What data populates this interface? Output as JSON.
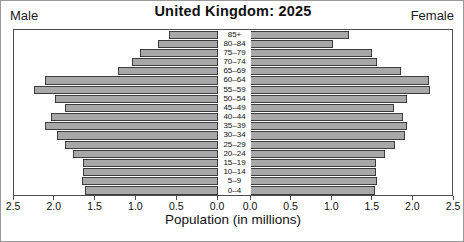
{
  "figure": {
    "title": "United Kingdom: 2025",
    "left_corner_label": "Male",
    "right_corner_label": "Female",
    "axis_title": "Population (in millions)"
  },
  "axis": {
    "left_ticks": [
      "2.5",
      "2.0",
      "1.5",
      "1.0",
      "0.5",
      "0.0"
    ],
    "right_ticks": [
      "0.0",
      "0.5",
      "1.0",
      "1.5",
      "2.0",
      "2.5"
    ]
  },
  "chart_data": {
    "type": "bar",
    "subtype": "population-pyramid",
    "title": "United Kingdom: 2025",
    "xlabel": "Population (in millions)",
    "ylabel": "",
    "xlim": [
      0,
      2.5
    ],
    "grid": false,
    "legend_position": "corners",
    "orientation": "horizontal",
    "categories": [
      "85+",
      "80-84",
      "75-79",
      "70-74",
      "65-69",
      "60-64",
      "55-59",
      "50-54",
      "45-49",
      "40-44",
      "35-39",
      "30-34",
      "25-29",
      "20-24",
      "15-19",
      "10-14",
      "5-9",
      "0-4"
    ],
    "series": [
      {
        "name": "Male",
        "side": "left",
        "values": [
          0.6,
          0.73,
          0.96,
          1.06,
          1.23,
          2.12,
          2.25,
          2.0,
          1.88,
          2.05,
          2.12,
          1.97,
          1.88,
          1.78,
          1.65,
          1.65,
          1.67,
          1.63
        ]
      },
      {
        "name": "Female",
        "side": "right",
        "values": [
          1.23,
          1.03,
          1.52,
          1.58,
          1.87,
          2.22,
          2.23,
          1.95,
          1.78,
          1.9,
          1.95,
          1.92,
          1.8,
          1.67,
          1.57,
          1.57,
          1.58,
          1.55
        ]
      }
    ],
    "bar_fill_color": "#a8a8a8",
    "bar_edge_color": "#3d3d3d"
  }
}
